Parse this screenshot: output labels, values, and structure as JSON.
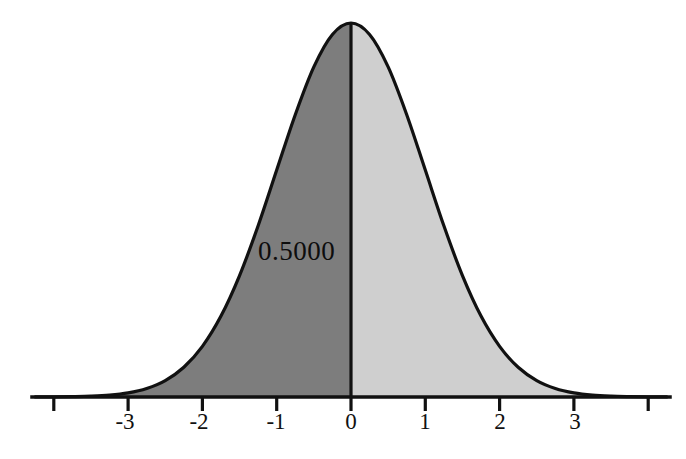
{
  "figure": {
    "background_color": "#ffffff",
    "axis_color": "#111111",
    "curve_color": "#111111",
    "left_fill_color": "#7d7d7d",
    "right_fill_color": "#cfcfcf",
    "divider_color": "#111111"
  },
  "annotation": {
    "area_label": "0.5000"
  },
  "axis": {
    "tick_labels": [
      "",
      "-3",
      "-2",
      "-1",
      "0",
      "1",
      "2",
      "3",
      ""
    ],
    "tick_values": [
      -4,
      -3,
      -2,
      -1,
      0,
      1,
      2,
      3,
      4
    ]
  },
  "chart_data": {
    "type": "area",
    "title": "",
    "subtitle": "",
    "xlabel": "",
    "ylabel": "",
    "xlim": [
      -4.25,
      4.25
    ],
    "ylim": [
      0,
      0.42
    ],
    "grid": false,
    "legend": "none",
    "distribution": "standard normal",
    "mean": 0,
    "std": 1,
    "peak_value": 0.3989,
    "x_ticks": [
      -4,
      -3,
      -2,
      -1,
      0,
      1,
      2,
      3,
      4
    ],
    "x_tick_labels": [
      "",
      "-3",
      "-2",
      "-1",
      "0",
      "1",
      "2",
      "3",
      ""
    ],
    "shaded_regions": [
      {
        "name": "left-half",
        "from": -4.25,
        "to": 0,
        "color": "#7d7d7d",
        "area": 0.5,
        "label": "0.5000"
      },
      {
        "name": "right-half",
        "from": 0,
        "to": 4.25,
        "color": "#cfcfcf",
        "area": 0.5,
        "label": ""
      }
    ],
    "annotations": [
      {
        "text": "0.5000",
        "x": -1.0,
        "y": 0.17
      }
    ],
    "series": [
      {
        "name": "standard normal pdf",
        "x": [
          -4.25,
          -4,
          -3.75,
          -3.5,
          -3.25,
          -3,
          -2.75,
          -2.5,
          -2.25,
          -2,
          -1.75,
          -1.5,
          -1.25,
          -1,
          -0.75,
          -0.5,
          -0.25,
          0,
          0.25,
          0.5,
          0.75,
          1,
          1.25,
          1.5,
          1.75,
          2,
          2.25,
          2.5,
          2.75,
          3,
          3.25,
          3.5,
          3.75,
          4,
          4.25
        ],
        "values": [
          0.0001,
          0.0001,
          0.0004,
          0.0009,
          0.002,
          0.0044,
          0.0091,
          0.0175,
          0.0317,
          0.054,
          0.0863,
          0.1295,
          0.1826,
          0.242,
          0.3011,
          0.3521,
          0.3867,
          0.3989,
          0.3867,
          0.3521,
          0.3011,
          0.242,
          0.1826,
          0.1295,
          0.0863,
          0.054,
          0.0317,
          0.0175,
          0.0091,
          0.0044,
          0.002,
          0.0009,
          0.0004,
          0.0001,
          0.0001
        ]
      }
    ]
  }
}
